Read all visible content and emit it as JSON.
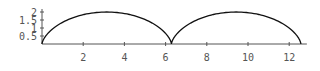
{
  "chart_data": {
    "type": "line",
    "title": "",
    "xlabel": "",
    "ylabel": "",
    "xlim": [
      0,
      12.566
    ],
    "ylim": [
      0,
      2
    ],
    "grid": false,
    "legend": null,
    "x_ticks": [
      2,
      4,
      6,
      8,
      10,
      12
    ],
    "x_tick_labels": [
      "2",
      "4",
      "6",
      "8",
      "10",
      "12"
    ],
    "y_ticks": [
      0.5,
      1,
      1.5,
      2
    ],
    "y_tick_labels": [
      "0.5",
      "1",
      "1.5",
      "2"
    ],
    "series": [
      {
        "name": "cycloid",
        "description": "Parametric cycloid x = t - sin t, y = 1 - cos t for t in [0, 4π]",
        "x": [
          0,
          0.0,
          0.05,
          0.36,
          1.14,
          2.37,
          3.14,
          3.91,
          5.14,
          5.92,
          6.23,
          6.28,
          6.33,
          6.64,
          7.42,
          8.65,
          9.42,
          10.19,
          11.42,
          12.2,
          12.52,
          12.57
        ],
        "y": [
          0,
          0.0,
          0.3,
          0.75,
          1.29,
          1.81,
          2.0,
          1.81,
          1.29,
          0.75,
          0.3,
          0.0,
          0.3,
          0.75,
          1.29,
          1.81,
          2.0,
          1.81,
          1.29,
          0.75,
          0.3,
          0.0
        ],
        "color": "#000000"
      }
    ]
  },
  "plot": {
    "origin_px": [
      42,
      44
    ],
    "x_px_per_unit": 20.6,
    "y_px_per_unit": 16,
    "axis_color": "#555555",
    "curve_color": "#111111"
  }
}
